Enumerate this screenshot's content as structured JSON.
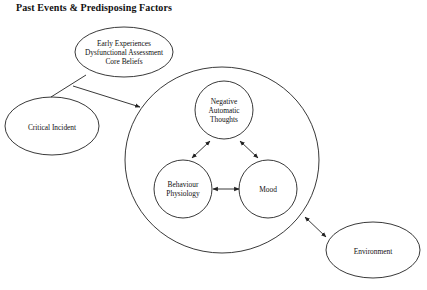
{
  "title": "Past Events & Predisposing Factors",
  "nodes": {
    "early": {
      "lines": [
        "Early Experiences",
        "Dysfunctional Assessment",
        "Core Beliefs"
      ]
    },
    "critical": {
      "label": "Critical Incident"
    },
    "nat": {
      "lines": [
        "Negative",
        "Automatic",
        "Thoughts"
      ]
    },
    "behaviour": {
      "lines": [
        "Behaviour",
        "Physiology"
      ]
    },
    "mood": {
      "label": "Mood"
    },
    "environment": {
      "label": "Environment"
    }
  },
  "colors": {
    "stroke": "#222222",
    "background": "#ffffff"
  }
}
